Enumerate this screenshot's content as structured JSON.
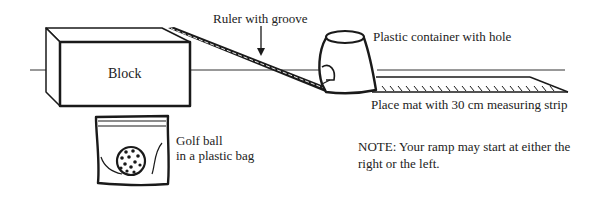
{
  "labels": {
    "block": "Block",
    "ruler": "Ruler with groove",
    "container": "Plastic container with hole",
    "mat": "Place mat with 30 cm measuring strip",
    "golf_line1": "Golf ball",
    "golf_line2": "in a plastic bag",
    "note": "NOTE: Your ramp may start at either the right or the left."
  },
  "colors": {
    "stroke": "#1a1a1a",
    "background": "#ffffff"
  }
}
